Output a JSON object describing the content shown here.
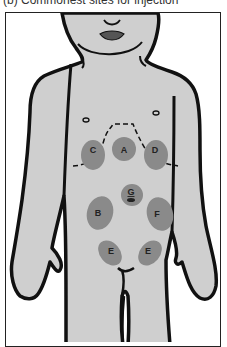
{
  "caption": "(b) Commonest sites for injection",
  "colors": {
    "skin": "#cfcfcf",
    "outline": "#111111",
    "site": "#8a8a8a",
    "background": "#ffffff"
  },
  "sites": [
    {
      "id": "A",
      "label": "A",
      "region": "epigastric / upper central"
    },
    {
      "id": "B",
      "label": "B",
      "region": "left-of-umbilicus abdomen"
    },
    {
      "id": "C",
      "label": "C",
      "region": "right upper quadrant"
    },
    {
      "id": "D",
      "label": "D",
      "region": "left upper quadrant"
    },
    {
      "id": "E1",
      "label": "E",
      "region": "right lower abdomen"
    },
    {
      "id": "E2",
      "label": "E",
      "region": "left lower abdomen"
    },
    {
      "id": "F",
      "label": "F",
      "region": "right-of-umbilicus abdomen"
    },
    {
      "id": "G",
      "label": "G",
      "region": "periumbilical"
    }
  ]
}
